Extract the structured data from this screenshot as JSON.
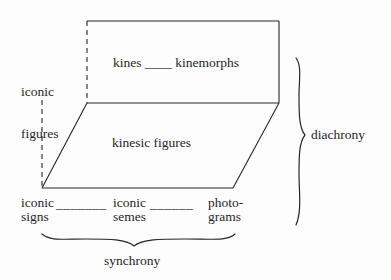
{
  "figure": {
    "kind": "semiotic-prism-diagram",
    "background_color": "#fdfdfd",
    "ink_color": "#262626"
  },
  "labels": {
    "left_axis": {
      "line1": "iconic",
      "line2": "figures"
    },
    "upper_face": "kines ____ kinemorphs",
    "middle_face": "kinesic figures",
    "right_brace_caption": "diachrony",
    "bottom_brace_caption": "synchrony"
  },
  "bottom_row": {
    "terms": [
      {
        "line1": "iconic",
        "line2": "signs"
      },
      {
        "line1": "iconic",
        "line2": "semes"
      },
      {
        "line1": "photo-",
        "line2": "grams"
      }
    ],
    "connectors": [
      "_______",
      "______"
    ]
  },
  "geometry": {
    "upper_face_vertices": "87,21 279,21 279,103 87,103",
    "middle_face_vertices": "87,103 279,103 233,188 42,188",
    "dashed_edges": [
      "87,21 to 87,103",
      "42,100 to 42,188"
    ],
    "right_brace_span": [
      58,
      225
    ],
    "bottom_brace_span": [
      42,
      235
    ]
  }
}
